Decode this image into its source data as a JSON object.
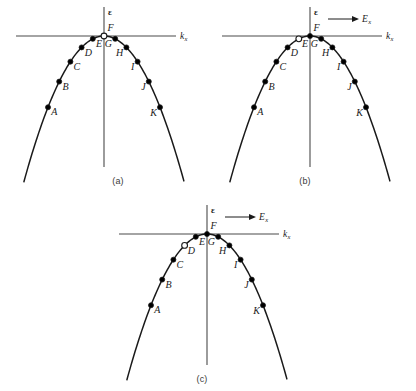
{
  "figure": {
    "axis": {
      "energy_label": "ε",
      "momentum_label": "k",
      "momentum_subscript": "x",
      "field_label": "E",
      "field_subscript": "x"
    },
    "colors": {
      "ink": "#1a1a1a",
      "axis": "#4a4a4a",
      "caption": "#3a3a3a",
      "background": "#ffffff",
      "filled_dot": "#000000",
      "open_dot": "#ffffff"
    },
    "panels": [
      {
        "id": "a",
        "caption": "(a)",
        "has_field_arrow": false,
        "field_arrow_label": "",
        "vacancy_at": "F",
        "points": [
          {
            "label": "A",
            "t": -5,
            "state": "filled",
            "side": "left"
          },
          {
            "label": "B",
            "t": -4,
            "state": "filled",
            "side": "left"
          },
          {
            "label": "C",
            "t": -3,
            "state": "filled",
            "side": "left"
          },
          {
            "label": "D",
            "t": -2,
            "state": "filled",
            "side": "left"
          },
          {
            "label": "E",
            "t": -1,
            "state": "filled",
            "side": "left"
          },
          {
            "label": "F",
            "t": 0,
            "state": "open",
            "side": "apex"
          },
          {
            "label": "G",
            "t": 1,
            "state": "filled",
            "side": "right"
          },
          {
            "label": "H",
            "t": 2,
            "state": "filled",
            "side": "right"
          },
          {
            "label": "I",
            "t": 3,
            "state": "filled",
            "side": "right"
          },
          {
            "label": "J",
            "t": 4,
            "state": "filled",
            "side": "right"
          },
          {
            "label": "K",
            "t": 5,
            "state": "filled",
            "side": "right"
          }
        ]
      },
      {
        "id": "b",
        "caption": "(b)",
        "has_field_arrow": true,
        "field_arrow_label": "E",
        "vacancy_at": "E",
        "points": [
          {
            "label": "A",
            "t": -5,
            "state": "filled",
            "side": "left"
          },
          {
            "label": "B",
            "t": -4,
            "state": "filled",
            "side": "left"
          },
          {
            "label": "C",
            "t": -3,
            "state": "filled",
            "side": "left"
          },
          {
            "label": "D",
            "t": -2,
            "state": "filled",
            "side": "left"
          },
          {
            "label": "E",
            "t": -1,
            "state": "open",
            "side": "left"
          },
          {
            "label": "F",
            "t": 0,
            "state": "filled",
            "side": "apex"
          },
          {
            "label": "G",
            "t": 1,
            "state": "filled",
            "side": "right"
          },
          {
            "label": "H",
            "t": 2,
            "state": "filled",
            "side": "right"
          },
          {
            "label": "I",
            "t": 3,
            "state": "filled",
            "side": "right"
          },
          {
            "label": "J",
            "t": 4,
            "state": "filled",
            "side": "right"
          },
          {
            "label": "K",
            "t": 5,
            "state": "filled",
            "side": "right"
          }
        ]
      },
      {
        "id": "c",
        "caption": "(c)",
        "has_field_arrow": true,
        "field_arrow_label": "E",
        "vacancy_at": "D",
        "points": [
          {
            "label": "A",
            "t": -5,
            "state": "filled",
            "side": "left"
          },
          {
            "label": "B",
            "t": -4,
            "state": "filled",
            "side": "left"
          },
          {
            "label": "C",
            "t": -3,
            "state": "filled",
            "side": "left"
          },
          {
            "label": "D",
            "t": -2,
            "state": "open",
            "side": "left"
          },
          {
            "label": "E",
            "t": -1,
            "state": "filled",
            "side": "left"
          },
          {
            "label": "F",
            "t": 0,
            "state": "filled",
            "side": "apex"
          },
          {
            "label": "G",
            "t": 1,
            "state": "filled",
            "side": "right"
          },
          {
            "label": "H",
            "t": 2,
            "state": "filled",
            "side": "right"
          },
          {
            "label": "I",
            "t": 3,
            "state": "filled",
            "side": "right"
          },
          {
            "label": "J",
            "t": 4,
            "state": "filled",
            "side": "right"
          },
          {
            "label": "K",
            "t": 5,
            "state": "filled",
            "side": "right"
          }
        ]
      }
    ]
  },
  "chart_data": {
    "type": "scatter",
    "xlabel": "k_x",
    "ylabel": "ε",
    "curve": "inverted parabola: ε = -0.95 * k_x^2",
    "grid": false,
    "legend": false,
    "panels": [
      {
        "name": "(a)",
        "field": null,
        "x": [
          -5,
          -4,
          -3,
          -2,
          -1,
          0,
          1,
          2,
          3,
          4,
          5
        ],
        "y": [
          -23.75,
          -15.2,
          -8.55,
          -3.8,
          -0.95,
          0,
          -0.95,
          -3.8,
          -8.55,
          -15.2,
          -23.75
        ],
        "labels": [
          "A",
          "B",
          "C",
          "D",
          "E",
          "F",
          "G",
          "H",
          "I",
          "J",
          "K"
        ],
        "states": [
          "filled",
          "filled",
          "filled",
          "filled",
          "filled",
          "open",
          "filled",
          "filled",
          "filled",
          "filled",
          "filled"
        ]
      },
      {
        "name": "(b)",
        "field": "E_x",
        "x": [
          -5,
          -4,
          -3,
          -2,
          -1,
          0,
          1,
          2,
          3,
          4,
          5
        ],
        "y": [
          -23.75,
          -15.2,
          -8.55,
          -3.8,
          -0.95,
          0,
          -0.95,
          -3.8,
          -8.55,
          -15.2,
          -23.75
        ],
        "labels": [
          "A",
          "B",
          "C",
          "D",
          "E",
          "F",
          "G",
          "H",
          "I",
          "J",
          "K"
        ],
        "states": [
          "filled",
          "filled",
          "filled",
          "filled",
          "open",
          "filled",
          "filled",
          "filled",
          "filled",
          "filled",
          "filled"
        ]
      },
      {
        "name": "(c)",
        "field": "E_x",
        "x": [
          -5,
          -4,
          -3,
          -2,
          -1,
          0,
          1,
          2,
          3,
          4,
          5
        ],
        "y": [
          -23.75,
          -15.2,
          -8.55,
          -3.8,
          -0.95,
          0,
          -0.95,
          -3.8,
          -8.55,
          -15.2,
          -23.75
        ],
        "labels": [
          "A",
          "B",
          "C",
          "D",
          "E",
          "F",
          "G",
          "H",
          "I",
          "J",
          "K"
        ],
        "states": [
          "filled",
          "filled",
          "filled",
          "open",
          "filled",
          "filled",
          "filled",
          "filled",
          "filled",
          "filled",
          "filled"
        ]
      }
    ]
  }
}
